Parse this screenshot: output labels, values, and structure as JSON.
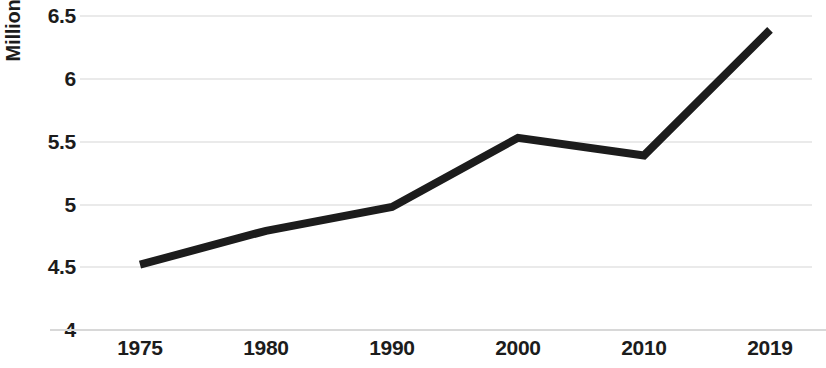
{
  "chart_data": {
    "type": "line",
    "title": "",
    "subtitle": "",
    "xlabel": "",
    "ylabel": "Millions",
    "categories": [
      "1975",
      "1980",
      "1990",
      "2000",
      "2010",
      "2019"
    ],
    "x": [
      1975,
      1980,
      1990,
      2000,
      2010,
      2019
    ],
    "values": [
      4.52,
      4.79,
      4.98,
      5.53,
      5.39,
      6.39
    ],
    "series": [
      {
        "name": "Millions",
        "values": [
          4.52,
          4.79,
          4.98,
          5.53,
          5.39,
          6.39
        ]
      }
    ],
    "ylim": [
      4,
      6.5
    ],
    "ytick_labels": [
      "6.5",
      "6",
      "5.5",
      "5",
      "4.5",
      "4"
    ],
    "ytick_values": [
      6.5,
      6,
      5.5,
      5,
      4.5,
      4
    ],
    "xtick_labels": [
      "1975",
      "1980",
      "1990",
      "2000",
      "2010",
      "2019"
    ],
    "grid": {
      "horizontal": true,
      "vertical": false,
      "color": "#e3e3e3"
    },
    "legend": {
      "visible": false,
      "position": "none",
      "entries": []
    },
    "annotations": [],
    "line_color": "#1c1c1c",
    "line_width": 8,
    "markers": false,
    "background_color": "#ffffff"
  },
  "axis": {
    "y_title": "Millions",
    "y_ticks": [
      "6.5",
      "6",
      "5.5",
      "5",
      "4.5",
      "4"
    ],
    "x_ticks": [
      "1975",
      "1980",
      "1990",
      "2000",
      "2010",
      "2019"
    ]
  }
}
